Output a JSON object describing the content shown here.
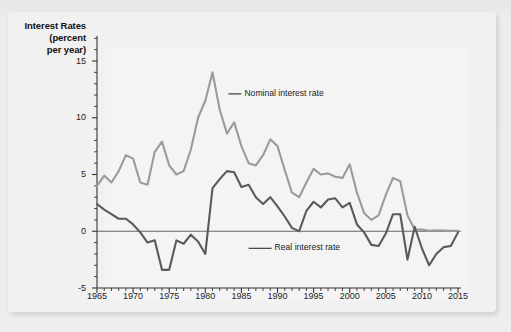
{
  "figure": {
    "axis_title_lines": [
      "Interest Rates",
      "(percent",
      "per year)"
    ],
    "axis_title": "Interest Rates (percent per year)"
  },
  "chart_data": {
    "type": "line",
    "xlabel": "",
    "ylabel": "Interest Rates (percent per year)",
    "xlim": [
      1965,
      2015
    ],
    "ylim": [
      -5,
      15
    ],
    "grid": false,
    "legend_position": "inline-annotation",
    "x_tick_labels": [
      "1965",
      "1970",
      "1975",
      "1980",
      "1985",
      "1990",
      "1995",
      "2000",
      "2005",
      "2010",
      "2015"
    ],
    "x_major_ticks": [
      1965,
      1970,
      1975,
      1980,
      1985,
      1990,
      1995,
      2000,
      2005,
      2010,
      2015
    ],
    "x_minor_tick_step": 1,
    "y_tick_labels": [
      "15",
      "10",
      "5",
      "0",
      "-5"
    ],
    "y_major_ticks": [
      15,
      10,
      5,
      0,
      -5
    ],
    "y_minor_tick_step": 1,
    "zero_line": 0,
    "colors": {
      "nominal": "#9b9b9b",
      "real": "#5a5a5a",
      "axis": "#333333",
      "plot_background": "#f4f4f4",
      "card_background": "#f1f1f1",
      "page_background": "#ececec"
    },
    "annotations": [
      {
        "text": "Nominal interest rate",
        "x": 1983.2,
        "y": 12.1
      },
      {
        "text": "Real interest rate",
        "x": 1986.0,
        "y": -1.5
      }
    ],
    "x": [
      1965,
      1966,
      1967,
      1968,
      1969,
      1970,
      1971,
      1972,
      1973,
      1974,
      1975,
      1976,
      1977,
      1978,
      1979,
      1980,
      1981,
      1982,
      1983,
      1984,
      1985,
      1986,
      1987,
      1988,
      1989,
      1990,
      1991,
      1992,
      1993,
      1994,
      1995,
      1996,
      1997,
      1998,
      1999,
      2000,
      2001,
      2002,
      2003,
      2004,
      2005,
      2006,
      2007,
      2008,
      2009,
      2010,
      2011,
      2012,
      2013,
      2014,
      2015
    ],
    "series": [
      {
        "name": "Nominal interest rate",
        "color": "#9b9b9b",
        "values": [
          4.0,
          4.9,
          4.3,
          5.3,
          6.7,
          6.4,
          4.3,
          4.1,
          7.0,
          7.9,
          5.8,
          5.0,
          5.3,
          7.2,
          10.0,
          11.5,
          14.0,
          10.7,
          8.6,
          9.6,
          7.5,
          6.0,
          5.8,
          6.7,
          8.1,
          7.5,
          5.4,
          3.4,
          3.0,
          4.3,
          5.5,
          5.0,
          5.1,
          4.8,
          4.7,
          5.9,
          3.4,
          1.6,
          1.0,
          1.4,
          3.2,
          4.7,
          4.4,
          1.4,
          0.15,
          0.14,
          0.05,
          0.09,
          0.06,
          0.03,
          0.05
        ]
      },
      {
        "name": "Real interest rate",
        "color": "#5a5a5a",
        "values": [
          2.4,
          1.9,
          1.5,
          1.1,
          1.1,
          0.6,
          -0.1,
          -1.0,
          -0.8,
          -3.4,
          -3.4,
          -0.8,
          -1.1,
          -0.3,
          -0.9,
          -2.0,
          3.8,
          4.6,
          5.3,
          5.2,
          3.9,
          4.1,
          3.0,
          2.4,
          3.0,
          2.2,
          1.3,
          0.3,
          0.0,
          1.8,
          2.6,
          2.1,
          2.8,
          2.9,
          2.1,
          2.5,
          0.6,
          -0.1,
          -1.2,
          -1.3,
          -0.2,
          1.5,
          1.5,
          -2.5,
          0.4,
          -1.5,
          -3.0,
          -2.0,
          -1.4,
          -1.3,
          -0.1
        ]
      }
    ]
  }
}
